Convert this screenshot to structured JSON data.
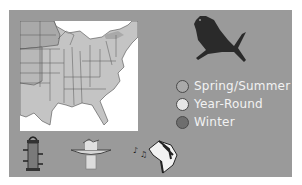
{
  "legend": {
    "items": [
      {
        "label": "Spring/Summer",
        "color": "#a9a9a9"
      },
      {
        "label": "Year-Round",
        "color": "#e6e6e6"
      },
      {
        "label": "Winter",
        "color": "#6e6e6e"
      }
    ]
  },
  "colors": {
    "panel": "#9a9a9a",
    "map_background": "#ffffff",
    "states": "#c4c4c4",
    "summer_region": "#a9a9a9",
    "bird": "#2a2a2a"
  },
  "icons": [
    "bird-silhouette-icon",
    "feeder-icon",
    "birdbath-icon",
    "bird-song-icon"
  ]
}
